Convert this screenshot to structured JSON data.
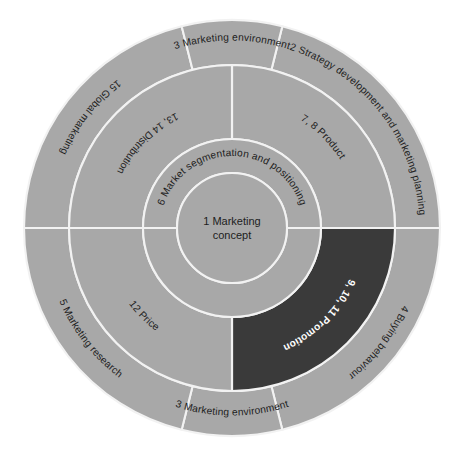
{
  "diagram": {
    "colors": {
      "segment_fill": "#a8a8a8",
      "segment_highlight_fill": "#3a3a3a",
      "separator": "#f2f2f2",
      "text": "#1d1d1d",
      "text_highlight": "#ffffff",
      "background": "#ffffff"
    },
    "geometry": {
      "center_x": 232,
      "center_y": 228,
      "radius_core": 55,
      "radius_inner_ring": 89,
      "radius_middle_ring": 163,
      "radius_outer_ring": 208
    },
    "core": {
      "name": "marketing-concept-core",
      "line1": "1 Marketing",
      "line2": "concept"
    },
    "inner_ring": {
      "name": "market-segmentation-ring",
      "label": "6 Market segmentation and positioning"
    },
    "middle_ring": {
      "segments": [
        {
          "key": "product",
          "label": "7, 8 Product",
          "highlighted": false,
          "start_angle": -90,
          "end_angle": 0
        },
        {
          "key": "promotion",
          "label": "9, 10, 11 Promotion",
          "highlighted": true,
          "start_angle": 0,
          "end_angle": 90
        },
        {
          "key": "price",
          "label": "12 Price",
          "highlighted": false,
          "start_angle": 90,
          "end_angle": 180
        },
        {
          "key": "distribution",
          "label": "13, 14 Distribution",
          "highlighted": false,
          "start_angle": 180,
          "end_angle": 270
        }
      ]
    },
    "outer_ring": {
      "segments": [
        {
          "key": "strategy",
          "label": "2 Strategy development and marketing planning",
          "start_angle": -76,
          "end_angle": 0
        },
        {
          "key": "buying-behaviour",
          "label": "4 Buying behaviour",
          "start_angle": 0,
          "end_angle": 76
        },
        {
          "key": "marketing-environment-bottom",
          "label": "3 Marketing environment",
          "start_angle": 76,
          "end_angle": 104
        },
        {
          "key": "marketing-research",
          "label": "5 Marketing research",
          "start_angle": 104,
          "end_angle": 180
        },
        {
          "key": "global-marketing",
          "label": "15 Global marketing",
          "start_angle": 180,
          "end_angle": 256
        },
        {
          "key": "marketing-environment-top",
          "label": "3 Marketing environment",
          "start_angle": 256,
          "end_angle": 284
        }
      ]
    }
  }
}
